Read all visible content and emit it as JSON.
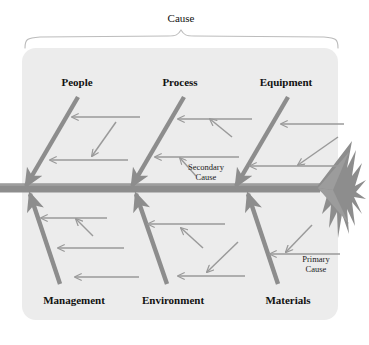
{
  "diagram": {
    "type": "fishbone-ishikawa",
    "title": "Cause",
    "panel": {
      "fill": "#ececec",
      "x": 22,
      "y": 48,
      "width": 316,
      "height": 272,
      "radius": 14
    },
    "brace": {
      "name": "cause-brace",
      "color": "#b9b9b9",
      "left_x": 25,
      "right_x": 338,
      "peak_x": 181,
      "baseline_y": 48,
      "peak_y": 31
    },
    "spine": {
      "name": "fish-spine",
      "color": "#8d8d8d",
      "y": 188,
      "left_x": 0,
      "right_x": 318,
      "thickness": 9
    },
    "tail": {
      "name": "fish-tail",
      "color": "#8d8d8d",
      "origin_x": 318,
      "origin_y": 188,
      "tip_x": 366,
      "ray_count": 7
    },
    "bone_color": "#8d8d8d",
    "sub_bone_color": "#9a9a9a",
    "top_branches": [
      {
        "label": "People",
        "label_x": 77,
        "label_y": 86,
        "bone": {
          "x1": 78,
          "y1": 97,
          "x2": 26,
          "y2": 186
        },
        "sub_bones": [
          {
            "kind": "horizontal",
            "x1": 140,
            "y1": 117,
            "x2": 72,
            "y2": 117
          },
          {
            "kind": "diagonal",
            "x1": 116,
            "y1": 122,
            "x2": 92,
            "y2": 156
          },
          {
            "kind": "horizontal",
            "x1": 128,
            "y1": 160,
            "x2": 50,
            "y2": 160
          }
        ]
      },
      {
        "label": "Process",
        "label_x": 180,
        "label_y": 86,
        "bone": {
          "x1": 184,
          "y1": 97,
          "x2": 132,
          "y2": 186
        },
        "sub_bones": [
          {
            "kind": "horizontal",
            "x1": 252,
            "y1": 119,
            "x2": 178,
            "y2": 119
          },
          {
            "kind": "diagonal",
            "x1": 232,
            "y1": 137,
            "x2": 210,
            "y2": 119
          },
          {
            "kind": "horizontal",
            "x1": 239,
            "y1": 157,
            "x2": 155,
            "y2": 157
          },
          {
            "kind": "diagonal",
            "x1": 196,
            "y1": 176,
            "x2": 180,
            "y2": 158
          }
        ]
      },
      {
        "label": "Equipment",
        "label_x": 282,
        "label_y": 86,
        "bone": {
          "x1": 288,
          "y1": 97,
          "x2": 236,
          "y2": 186
        },
        "sub_bones": [
          {
            "kind": "horizontal",
            "x1": 344,
            "y1": 124,
            "x2": 281,
            "y2": 124
          },
          {
            "kind": "diagonal",
            "x1": 338,
            "y1": 137,
            "x2": 298,
            "y2": 165
          },
          {
            "kind": "horizontal",
            "x1": 340,
            "y1": 166,
            "x2": 250,
            "y2": 166
          }
        ]
      }
    ],
    "bottom_branches": [
      {
        "label": "Management",
        "label_x": 74,
        "label_y": 304,
        "bone": {
          "x1": 60,
          "y1": 284,
          "x2": 30,
          "y2": 194
        },
        "sub_bones": [
          {
            "kind": "horizontal",
            "x1": 107,
            "y1": 218,
            "x2": 41,
            "y2": 218
          },
          {
            "kind": "diagonal",
            "x1": 93,
            "y1": 236,
            "x2": 76,
            "y2": 219
          },
          {
            "kind": "horizontal",
            "x1": 124,
            "y1": 248,
            "x2": 58,
            "y2": 248
          },
          {
            "kind": "horizontal",
            "x1": 139,
            "y1": 277,
            "x2": 75,
            "y2": 277
          }
        ]
      },
      {
        "label": "Environment",
        "label_x": 171,
        "label_y": 304,
        "bone": {
          "x1": 167,
          "y1": 284,
          "x2": 136,
          "y2": 194
        },
        "sub_bones": [
          {
            "kind": "horizontal",
            "x1": 225,
            "y1": 224,
            "x2": 148,
            "y2": 224
          },
          {
            "kind": "diagonal",
            "x1": 203,
            "y1": 248,
            "x2": 181,
            "y2": 228
          },
          {
            "kind": "diagonal",
            "x1": 238,
            "y1": 242,
            "x2": 207,
            "y2": 272
          },
          {
            "kind": "horizontal",
            "x1": 245,
            "y1": 276,
            "x2": 178,
            "y2": 276
          }
        ]
      },
      {
        "label": "Materials",
        "label_x": 282,
        "label_y": 304,
        "bone": {
          "x1": 278,
          "y1": 284,
          "x2": 248,
          "y2": 194
        },
        "sub_bones": [
          {
            "kind": "diagonal",
            "x1": 312,
            "y1": 225,
            "x2": 286,
            "y2": 252
          },
          {
            "kind": "horizontal",
            "x1": 340,
            "y1": 254,
            "x2": 270,
            "y2": 254
          }
        ]
      }
    ],
    "annotations": [
      {
        "name": "secondary-cause-note",
        "line1": "Secondary",
        "line2": "Cause",
        "x": 206,
        "y1": 170,
        "y2": 180,
        "pointer": {
          "x1": 196,
          "y1": 176,
          "x2": 180,
          "y2": 158
        }
      },
      {
        "name": "primary-cause-note",
        "line1": "Primary",
        "line2": "Cause",
        "x": 316,
        "y1": 262,
        "y2": 272,
        "pointer": {
          "x1": 312,
          "y1": 225,
          "x2": 286,
          "y2": 252
        }
      }
    ]
  }
}
